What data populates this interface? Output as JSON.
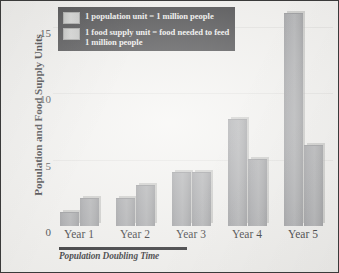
{
  "chart_data": {
    "type": "bar",
    "title": "",
    "xlabel": "",
    "ylabel": "Population and Food Supply Units",
    "categories": [
      "Year 1",
      "Year 2",
      "Year 3",
      "Year 4",
      "Year 5"
    ],
    "series": [
      {
        "name": "1 population unit = 1 million people",
        "values": [
          1,
          2,
          4,
          8,
          16
        ]
      },
      {
        "name": "1 food supply unit = food needed to feed 1 million people",
        "values": [
          2,
          3,
          4,
          5,
          6
        ]
      }
    ],
    "ylim": [
      0,
      16.5
    ],
    "yticks": [
      0,
      5,
      10,
      15
    ],
    "ytick_labels": [
      "0",
      "5",
      "10",
      "15"
    ],
    "grid": true,
    "legend_position": "top-left",
    "annotations": [
      {
        "text": "Population Doubling Time",
        "spans": [
          "Year 1",
          "Year 2"
        ],
        "style": "bold-italic-underbar"
      }
    ]
  },
  "legend": {
    "items": [
      {
        "swatch_name": "population-swatch",
        "text_line_1": "1 population unit = 1 million people",
        "text_line_2": ""
      },
      {
        "swatch_name": "food-supply-swatch",
        "text_line_1": "1 food supply unit = food needed to",
        "text_line_2": "feed 1 million people"
      }
    ]
  },
  "annotation": {
    "doubling_time_label": "Population Doubling Time"
  },
  "colors": {
    "background": "#f2f1ee",
    "border": "#3a3a3a",
    "bar_fill": "#9a9b9d",
    "bar_highlight": "#a5a6a8",
    "gridline": "#e2e1de",
    "legend_background": "#2b2b2d",
    "legend_text": "#efefec",
    "text": "#17171a"
  }
}
